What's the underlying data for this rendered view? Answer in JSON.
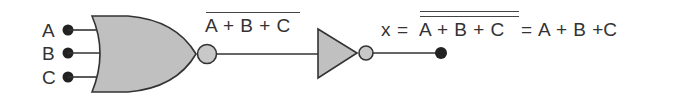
{
  "diagram": {
    "inputs": [
      {
        "label": "A"
      },
      {
        "label": "B"
      },
      {
        "label": "C"
      }
    ],
    "nor_output_expression": "A + B + C",
    "output": {
      "var": "x",
      "eq": "=",
      "expr_barred": "A + B + C",
      "eq2": "=",
      "expr_result": "A + B +C"
    },
    "colors": {
      "gate_fill": "#c0c0c0",
      "stroke": "#333333",
      "dot": "#222222"
    }
  }
}
